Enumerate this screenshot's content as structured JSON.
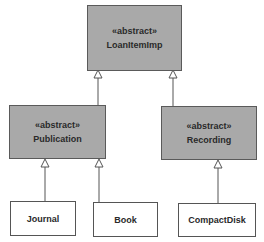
{
  "diagram": {
    "type": "UML class diagram (generalization hierarchy)",
    "colors": {
      "abstract_fill": "#a9a9a9",
      "concrete_fill": "#ffffff",
      "border": "#555555",
      "text": "#2a2a2a",
      "edge": "#555555"
    },
    "classes": {
      "loanitemimp": {
        "stereotype": "«abstract»",
        "name": "LoanItemImp"
      },
      "publication": {
        "stereotype": "«abstract»",
        "name": "Publication"
      },
      "recording": {
        "stereotype": "«abstract»",
        "name": "Recording"
      },
      "journal": {
        "name": "Journal"
      },
      "book": {
        "name": "Book"
      },
      "compactdisk": {
        "name": "CompactDisk"
      }
    },
    "generalizations": [
      {
        "child": "Publication",
        "parent": "LoanItemImp"
      },
      {
        "child": "Recording",
        "parent": "LoanItemImp"
      },
      {
        "child": "Journal",
        "parent": "Publication"
      },
      {
        "child": "Book",
        "parent": "Publication"
      },
      {
        "child": "CompactDisk",
        "parent": "Recording"
      }
    ]
  }
}
